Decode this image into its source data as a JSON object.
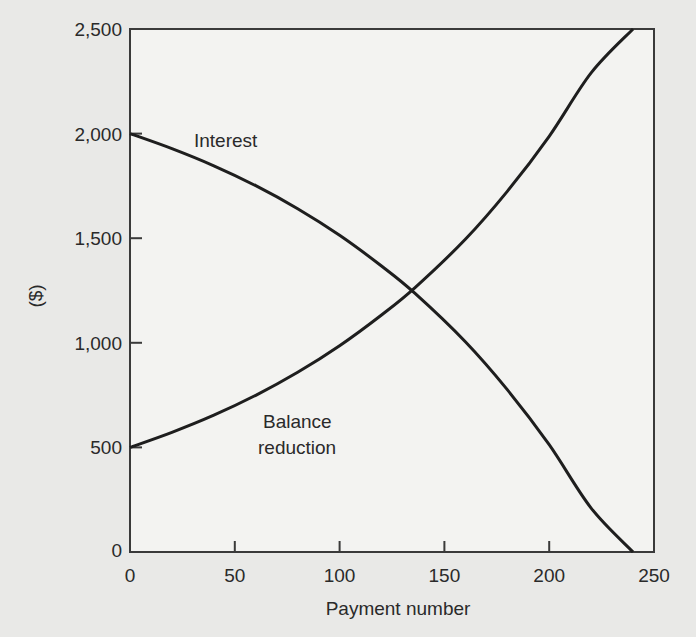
{
  "chart_data": {
    "type": "line",
    "title": "",
    "xlabel": "Payment number",
    "ylabel": "($)",
    "xlim": [
      0,
      250
    ],
    "ylim": [
      0,
      2500
    ],
    "x_ticks": [
      0,
      50,
      100,
      150,
      200,
      250
    ],
    "x_tick_labels": [
      "0",
      "50",
      "100",
      "150",
      "200",
      "250"
    ],
    "y_ticks": [
      0,
      500,
      1000,
      1500,
      2000,
      2500
    ],
    "y_tick_labels": [
      "0",
      "500",
      "1,000",
      "1,500",
      "2,000",
      "2,500"
    ],
    "grid": false,
    "legend": "none",
    "annotations": [
      {
        "text": "Interest",
        "series": "Interest"
      },
      {
        "text": "Balance",
        "series": "Balance reduction"
      },
      {
        "text": "reduction",
        "series": "Balance reduction"
      }
    ],
    "x": [
      0,
      20,
      40,
      60,
      80,
      100,
      120,
      136,
      160,
      180,
      200,
      220,
      240
    ],
    "series": [
      {
        "name": "Interest",
        "values": [
          2000,
          1928,
          1846,
          1751,
          1641,
          1514,
          1367,
          1236,
          1005,
          776,
          513,
          210,
          0
        ]
      },
      {
        "name": "Balance reduction",
        "values": [
          500,
          572,
          654,
          749,
          859,
          986,
          1133,
          1264,
          1495,
          1724,
          1987,
          2290,
          2500
        ]
      }
    ]
  }
}
